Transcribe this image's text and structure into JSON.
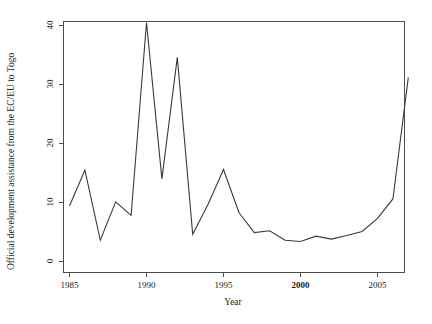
{
  "chart_data": {
    "type": "line",
    "title": "",
    "xlabel": "Year",
    "ylabel": "Official development assistance from the EC/EU to Togo",
    "xlim": [
      1984.6,
      17.4
    ],
    "x_range": [
      1984.6,
      2007.6
    ],
    "ylim": [
      0,
      41
    ],
    "grid": false,
    "legend": null,
    "xticks": [
      1985,
      1990,
      1995,
      2000,
      2005
    ],
    "xtick_labels": [
      "1985",
      "1990",
      "1995",
      "2000",
      "2005"
    ],
    "xtick_bold": [
      "2000"
    ],
    "yticks": [
      0,
      10,
      20,
      30,
      40
    ],
    "ytick_labels": [
      "0",
      "10",
      "20",
      "30",
      "40"
    ],
    "x": [
      1985,
      1986,
      1987,
      1988,
      1989,
      1990,
      1991,
      1992,
      1993,
      1994,
      1995,
      1996,
      1997,
      1998,
      1999,
      2000,
      2001,
      2002,
      2003,
      2004,
      2005,
      2006,
      2007
    ],
    "values": [
      9.4,
      15.5,
      3.6,
      10.1,
      7.8,
      40.5,
      14.0,
      34.6,
      4.6,
      9.7,
      15.6,
      8.3,
      4.9,
      5.2,
      3.6,
      3.4,
      4.3,
      3.8,
      4.4,
      5.1,
      7.3,
      10.6,
      31.2
    ],
    "series_color": "#3a3a3a",
    "axis_color": "#4d4d4d"
  },
  "labels": {
    "xlabel": "Year",
    "ylabel": "Official development assistance from the EC/EU to Togo"
  }
}
